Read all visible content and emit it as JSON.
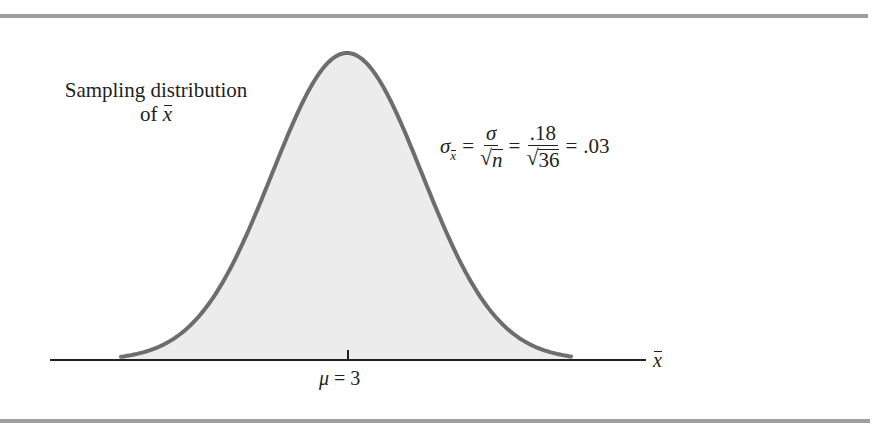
{
  "chart_data": {
    "type": "area",
    "title_line1": "Sampling distribution",
    "title_line2_prefix": "of",
    "title_line2_var": "x",
    "xlabel": "x̄",
    "axis_var": "x",
    "distribution": "normal",
    "mean": 3,
    "standard_error": 0.03,
    "sigma": 0.18,
    "n": 36,
    "tick_labels": [
      {
        "x": 3,
        "label": "μ = 3"
      }
    ],
    "mu_symbol": "μ",
    "mu_eq": " = 3",
    "formula": {
      "sigma": "σ",
      "sub_var": "x",
      "eq1": "=",
      "num1": "σ",
      "den1": "n",
      "eq2": "=",
      "num2": ".18",
      "den2": "36",
      "eq3": "=",
      "result": ".03"
    },
    "colors": {
      "curve": "#6d6d6d",
      "fill": "#ececec",
      "axis": "#231f20",
      "frame_bars": "#9e9e9e"
    },
    "grid": false,
    "legend": null
  }
}
